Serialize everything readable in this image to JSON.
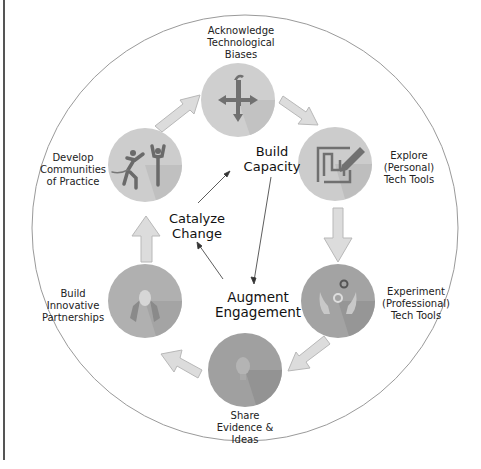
{
  "diagram": {
    "type": "cycle",
    "stages": [
      {
        "id": "acknowledge",
        "label_lines": [
          "Acknowledge",
          "Technological",
          "Biases"
        ],
        "icon": "person-arrows-icon"
      },
      {
        "id": "explore",
        "label_lines": [
          "Explore",
          "(Personal)",
          "Tech Tools"
        ],
        "icon": "maze-pencil-icon"
      },
      {
        "id": "experiment",
        "label_lines": [
          "Experiment",
          "(Professional)",
          "Tech Tools"
        ],
        "icon": "hands-gears-icon"
      },
      {
        "id": "share",
        "label_lines": [
          "Share",
          "Evidence &",
          "Ideas"
        ],
        "icon": "lightbulb-icon"
      },
      {
        "id": "partnerships",
        "label_lines": [
          "Build",
          "Innovative",
          "Partnerships"
        ],
        "icon": "handshake-icon"
      },
      {
        "id": "communities",
        "label_lines": [
          "Develop",
          "Communities",
          "of Practice"
        ],
        "icon": "people-celebrating-icon"
      }
    ],
    "center": {
      "build_capacity": [
        "Build",
        "Capacity"
      ],
      "catalyze_change": [
        "Catalyze",
        "Change"
      ],
      "augment_engagement": [
        "Augment",
        "Engagement"
      ]
    },
    "colors": {
      "circle_light": "#cfcfcf",
      "circle_mid": "#b5b5b5",
      "circle_dark": "#9a9a9a",
      "arrow_fill": "#dcdcdc",
      "arrow_stroke": "#b8b8b8",
      "outline": "#9a9a9a",
      "icon_dark": "#6e6e6e"
    }
  }
}
